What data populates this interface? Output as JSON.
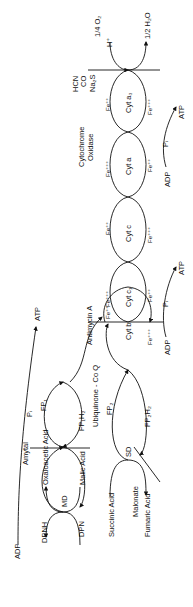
{
  "diagram": {
    "substrates": {
      "malic_acid": "Malic Acid",
      "oxaloacetic_acid": "Oxaloacetic Acid",
      "md": "MD",
      "succinic_acid": "Succinic Acid",
      "fumaric_acid": "Fumaric Acid",
      "sd": "SD",
      "malonate": "Malonate"
    },
    "carriers": {
      "dpnh": "DPNH",
      "dpn": "DPN",
      "fp1": "FP₁",
      "fp1h2": "FP₁H₂",
      "fp2": "FP₂",
      "fp2h2": "FP₂H₂",
      "ubiquinone": "Ubiquinone - Co Q",
      "cyt_b": "Cyt b",
      "cyt_c1": "Cyt c₁",
      "cyt_c": "Cyt c",
      "cyt_a": "Cyt a",
      "cyt_a3": "Cyt a₃",
      "fe2": "Fe⁺⁺",
      "fe3": "Fe⁺⁺⁺"
    },
    "inhibitors": {
      "amytal": "Amytal",
      "antimycin": "Antimycin A",
      "hcn": "HCN",
      "co": "CO",
      "na2s": "Na₂S"
    },
    "phosphorylation": {
      "adp": "ADP",
      "pi": "Pᵢ",
      "atp": "ATP"
    },
    "enzyme": {
      "line1": "Cytochrome",
      "line2": "Oxidase"
    },
    "oxygen": {
      "o2": "1/4 O₂",
      "h": "H⁺",
      "water": "1/2 H₂O"
    }
  }
}
